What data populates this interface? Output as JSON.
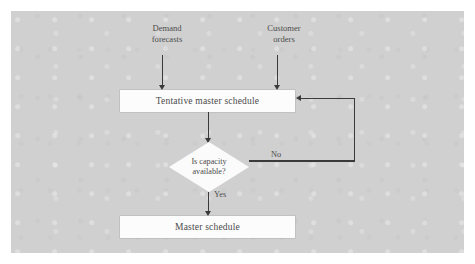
{
  "figure": {
    "panel_color": "#d0d0d0",
    "node_fill": "#fcfcfc",
    "line_color": "#3a3a3a",
    "text_color": "#4a4a4a"
  },
  "inputs": [
    {
      "id": "demand-forecasts",
      "line1": "Demand",
      "line2": "forecasts"
    },
    {
      "id": "customer-orders",
      "line1": "Customer",
      "line2": "orders"
    }
  ],
  "nodes": {
    "tentative_schedule": "Tentative master schedule",
    "decision_line1": "Is capacity",
    "decision_line2": "available?",
    "master_schedule": "Master schedule"
  },
  "edge_labels": {
    "no": "No",
    "yes": "Yes"
  }
}
